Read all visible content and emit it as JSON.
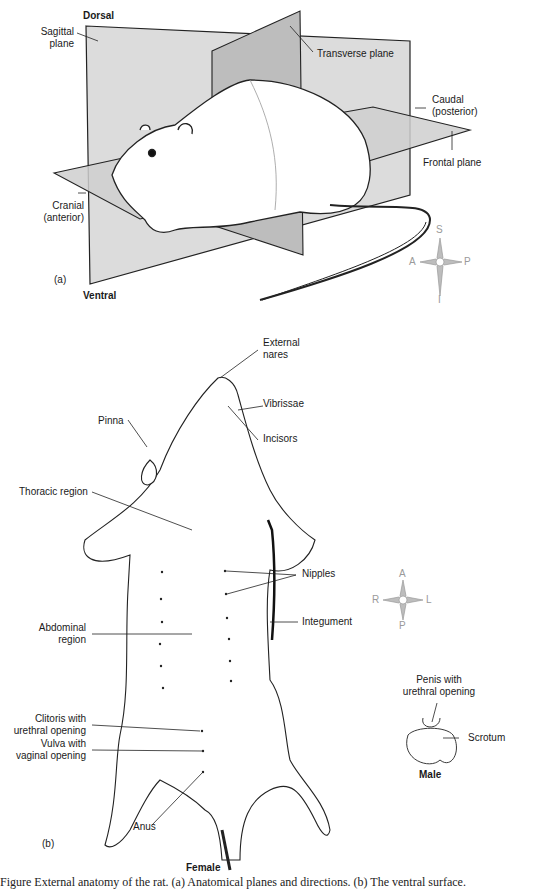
{
  "figure_a": {
    "panel_label": "(a)",
    "labels": {
      "dorsal": "Dorsal",
      "ventral": "Ventral",
      "sagittal_1": "Sagittal",
      "sagittal_2": "plane",
      "transverse": "Transverse plane",
      "caudal_1": "Caudal",
      "caudal_2": "(posterior)",
      "frontal": "Frontal plane",
      "cranial_1": "Cranial",
      "cranial_2": "(anterior)"
    },
    "compass": {
      "top": "S",
      "bottom": "I",
      "left": "A",
      "right": "P"
    }
  },
  "figure_b": {
    "panel_label": "(b)",
    "labels": {
      "external_nares_1": "External",
      "external_nares_2": "nares",
      "vibrissae": "Vibrissae",
      "incisors": "Incisors",
      "pinna": "Pinna",
      "thoracic": "Thoracic region",
      "nipples": "Nipples",
      "integument": "Integument",
      "abdominal_1": "Abdominal",
      "abdominal_2": "region",
      "clitoris_1": "Clitoris with",
      "clitoris_2": "urethral opening",
      "vulva_1": "Vulva with",
      "vulva_2": "vaginal opening",
      "anus": "Anus",
      "penis_1": "Penis with",
      "penis_2": "urethral opening",
      "scrotum": "Scrotum",
      "female": "Female",
      "male": "Male"
    },
    "compass": {
      "top": "A",
      "bottom": "P",
      "left": "R",
      "right": "L"
    }
  },
  "caption": "Figure      External anatomy of the rat. (a) Anatomical planes and directions. (b) The ventral surface."
}
